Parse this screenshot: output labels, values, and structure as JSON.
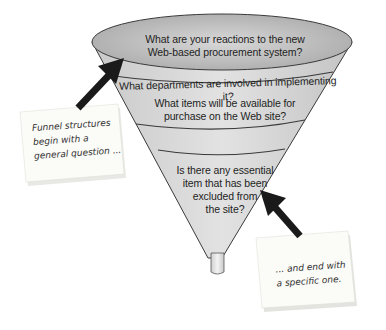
{
  "diagram": {
    "type": "funnel",
    "levels": [
      {
        "line1": "What are your reactions to the new",
        "line2": "Web-based procurement system?"
      },
      {
        "line1": "What departments are involved in implementing it?"
      },
      {
        "line1": "What items will be available for",
        "line2": "purchase on the Web site?"
      },
      {
        "line1": "Is there any essential",
        "line2": "item that has been",
        "line3": "excluded from",
        "line4": "the site?"
      }
    ],
    "notes": {
      "left": {
        "line1": "Funnel structures",
        "line2": "begin with a",
        "line3": "general question ..."
      },
      "right": {
        "line1": "... and end with",
        "line2": "a specific one."
      }
    },
    "colors": {
      "funnel_fill": "#d4d4d4",
      "rim_fill": "#bdbdbd",
      "outline": "#3a3a3a",
      "arrow": "#1a1a1a",
      "note_bg": "#fbfbf8"
    }
  }
}
